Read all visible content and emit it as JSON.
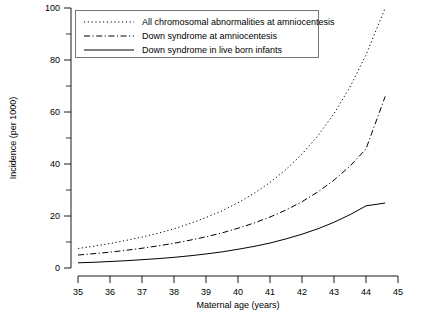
{
  "chart_data": {
    "type": "line",
    "title": "",
    "xlabel": "Maternal age (years)",
    "ylabel": "Incidence (per 1000)",
    "xlim": [
      35,
      45
    ],
    "ylim": [
      0,
      100
    ],
    "xticks": [
      35,
      36,
      37,
      38,
      39,
      40,
      41,
      42,
      43,
      44,
      45
    ],
    "yticks": [
      0,
      20,
      40,
      60,
      80,
      100
    ],
    "yticks_minor": [
      10,
      30,
      50,
      70,
      90
    ],
    "grid": false,
    "legend_position": "top-left",
    "x": [
      35,
      35.5,
      36,
      36.5,
      37,
      37.5,
      38,
      38.5,
      39,
      39.5,
      40,
      40.5,
      41,
      41.5,
      42,
      42.5,
      43,
      43.5,
      44,
      44.6
    ],
    "series": [
      {
        "name": "All chromosomal abnormalities at amniocentesis",
        "style": "dotted",
        "values": [
          7.5,
          8.4,
          9.4,
          10.6,
          11.9,
          13.4,
          15.1,
          17.1,
          19.4,
          22.0,
          25.1,
          28.7,
          32.9,
          37.9,
          43.8,
          50.9,
          59.4,
          69.6,
          82.0,
          100.0
        ]
      },
      {
        "name": "Down syndrome at amniocentesis",
        "style": "dash-dot",
        "values": [
          5.0,
          5.5,
          6.1,
          6.8,
          7.6,
          8.5,
          9.5,
          10.7,
          12.0,
          13.5,
          15.3,
          17.3,
          19.6,
          22.3,
          25.5,
          29.3,
          33.8,
          39.2,
          45.8,
          66.0
        ]
      },
      {
        "name": "Down syndrome in live born infants",
        "style": "solid",
        "values": [
          2.0,
          2.2,
          2.5,
          2.8,
          3.2,
          3.6,
          4.1,
          4.7,
          5.4,
          6.2,
          7.2,
          8.3,
          9.6,
          11.2,
          13.0,
          15.1,
          17.6,
          20.5,
          23.9,
          25.0
        ]
      }
    ],
    "colors": {
      "axis": "#000000",
      "series": "#000000",
      "legend_border": "#555555",
      "background": "#ffffff"
    }
  },
  "legend": {
    "entries": [
      {
        "label": "All chromosomal abnormalities at amniocentesis"
      },
      {
        "label": "Down syndrome at amniocentesis"
      },
      {
        "label": "Down syndrome in live born infants"
      }
    ]
  },
  "axes": {
    "x_title": "Maternal age (years)",
    "y_title": "Incidence (per 1000)",
    "x_tick_labels": [
      "35",
      "36",
      "37",
      "38",
      "39",
      "40",
      "41",
      "42",
      "43",
      "44",
      "45"
    ],
    "y_tick_labels": [
      "0",
      "20",
      "40",
      "60",
      "80",
      "100"
    ]
  }
}
